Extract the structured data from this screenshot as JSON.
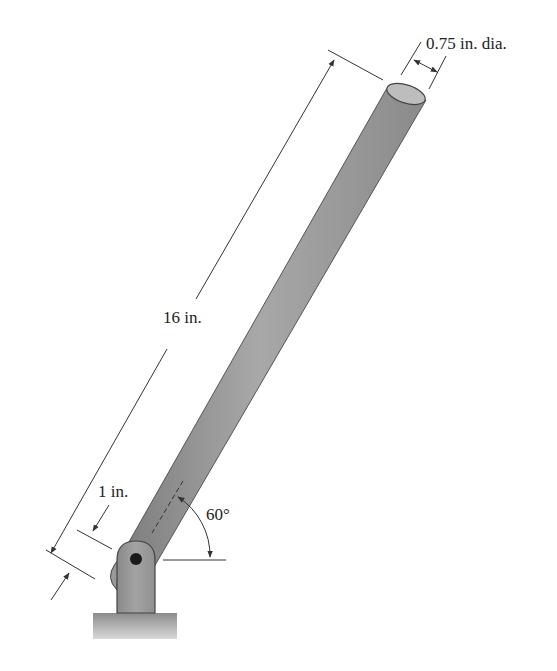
{
  "figure": {
    "type": "engineering-diagram",
    "labels": {
      "diameter": "0.75 in. dia.",
      "length": "16 in.",
      "offset": "1 in.",
      "angle": "60°"
    },
    "colors": {
      "rod": "#8f8f8f",
      "rod_light": "#b5b5b5",
      "outline": "#444444",
      "ground": "#9a9a9a",
      "dimension_line": "#333333"
    }
  }
}
